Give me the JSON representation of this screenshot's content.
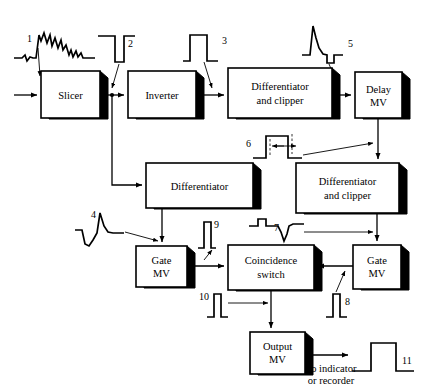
{
  "diagram": {
    "blocks": [
      {
        "id": "slicer",
        "label_line1": "Slicer",
        "label_line2": "",
        "x": 41,
        "y": 71,
        "w": 59,
        "h": 47
      },
      {
        "id": "inverter",
        "label_line1": "Inverter",
        "label_line2": "",
        "x": 128,
        "y": 71,
        "w": 68,
        "h": 47
      },
      {
        "id": "diff-clip-top",
        "label_line1": "Differentiator",
        "label_line2": "and clipper",
        "x": 228,
        "y": 68,
        "w": 104,
        "h": 50
      },
      {
        "id": "delay-mv",
        "label_line1": "Delay",
        "label_line2": "MV",
        "x": 355,
        "y": 72,
        "w": 47,
        "h": 46
      },
      {
        "id": "differentiator",
        "label_line1": "Differentiator",
        "label_line2": "",
        "x": 146,
        "y": 163,
        "w": 107,
        "h": 45
      },
      {
        "id": "diff-clip-mid",
        "label_line1": "Differentiator",
        "label_line2": "and clipper",
        "x": 296,
        "y": 163,
        "w": 103,
        "h": 50
      },
      {
        "id": "gate-mv-left",
        "label_line1": "Gate",
        "label_line2": "MV",
        "x": 136,
        "y": 246,
        "w": 51,
        "h": 41
      },
      {
        "id": "coincidence",
        "label_line1": "Coincidence",
        "label_line2": "switch",
        "x": 228,
        "y": 245,
        "w": 86,
        "h": 45
      },
      {
        "id": "gate-mv-right",
        "label_line1": "Gate",
        "label_line2": "MV",
        "x": 353,
        "y": 245,
        "w": 48,
        "h": 44
      },
      {
        "id": "output-mv",
        "label_line1": "Output",
        "label_line2": "MV",
        "x": 250,
        "y": 332,
        "w": 55,
        "h": 42
      }
    ],
    "waveform_numbers": [
      {
        "id": "wave-1",
        "label": "1",
        "x": 27,
        "y": 42
      },
      {
        "id": "wave-2",
        "label": "2",
        "x": 128,
        "y": 47
      },
      {
        "id": "wave-3",
        "label": "3",
        "x": 222,
        "y": 44
      },
      {
        "id": "wave-4",
        "label": "4",
        "x": 91,
        "y": 218
      },
      {
        "id": "wave-5",
        "label": "5",
        "x": 348,
        "y": 47
      },
      {
        "id": "wave-6",
        "label": "6",
        "x": 246,
        "y": 147
      },
      {
        "id": "wave-7",
        "label": "7",
        "x": 274,
        "y": 231
      },
      {
        "id": "wave-8",
        "label": "8",
        "x": 345,
        "y": 305
      },
      {
        "id": "wave-9",
        "label": "9",
        "x": 214,
        "y": 228
      },
      {
        "id": "wave-10",
        "label": "10",
        "x": 199,
        "y": 300
      },
      {
        "id": "wave-11",
        "label": "11",
        "x": 402,
        "y": 364
      }
    ],
    "notes": [
      {
        "id": "output-destination-line1",
        "text": "To indicator",
        "x": 331,
        "y": 372
      },
      {
        "id": "output-destination-line2",
        "text": "or recorder",
        "x": 331,
        "y": 384
      }
    ],
    "colors": {
      "line": "#000000",
      "box_fill": "#ffffff",
      "shadow": "#000000",
      "background": "#ffffff"
    }
  }
}
